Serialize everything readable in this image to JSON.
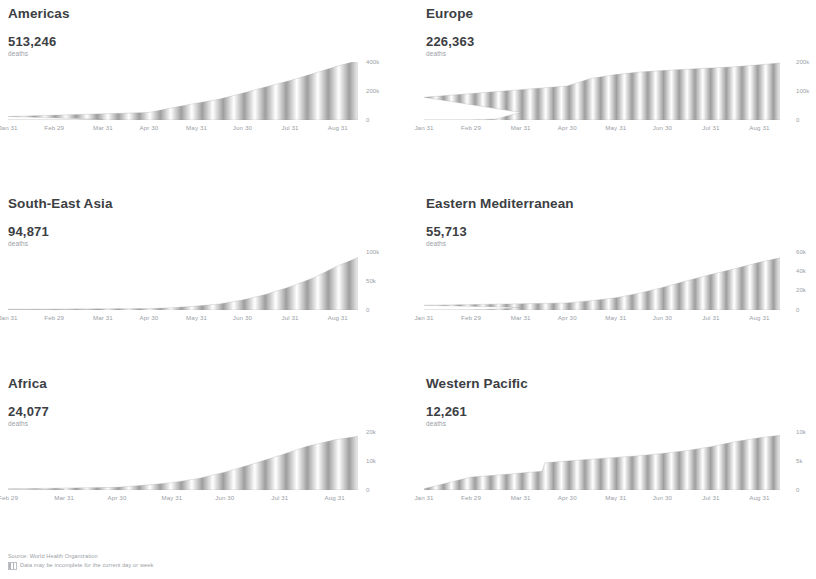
{
  "footer": {
    "source": "Source: World Health Organization",
    "note": "Data may be incomplete for the current day or week",
    "note_icon": "hatched-square-icon"
  },
  "colors": {
    "title": "#3c4043",
    "value": "#3c4043",
    "muted": "#9aa0a6",
    "series_fill": "#9e9e9e",
    "background": "#ffffff"
  },
  "unit_label": "deaths",
  "chart_data": [
    {
      "type": "area",
      "title": "Americas",
      "total_value": "513,246",
      "total_value_number": 513246,
      "unit": "deaths",
      "xlabel": "",
      "ylabel": "",
      "grid": false,
      "legend": "none",
      "x_ticks": [
        "Jan 31",
        "Feb 29",
        "Mar 31",
        "Apr 30",
        "May 31",
        "Jun 30",
        "Jul 31",
        "Aug 31"
      ],
      "y_ticks": [
        "400k",
        "200k",
        "0"
      ],
      "ylim": [
        0,
        500000
      ],
      "series": [
        {
          "name": "Cumulative deaths",
          "x": [
            "Jan 31",
            "Feb 29",
            "Mar 15",
            "Mar 31",
            "Apr 15",
            "Apr 30",
            "May 15",
            "May 31",
            "Jun 15",
            "Jun 30",
            "Jul 15",
            "Jul 31",
            "Aug 15",
            "Aug 31",
            "Sep 10"
          ],
          "values": [
            0,
            0,
            800,
            5500,
            30000,
            65000,
            105000,
            145000,
            180000,
            230000,
            285000,
            340000,
            400000,
            465000,
            513246
          ]
        }
      ]
    },
    {
      "type": "area",
      "title": "Europe",
      "total_value": "226,363",
      "total_value_number": 226363,
      "unit": "deaths",
      "xlabel": "",
      "ylabel": "",
      "grid": false,
      "legend": "none",
      "x_ticks": [
        "Jan 31",
        "Feb 29",
        "Mar 31",
        "Apr 30",
        "May 31",
        "Jun 30",
        "Jul 31",
        "Aug 31"
      ],
      "y_ticks": [
        "200k",
        "100k",
        "0"
      ],
      "ylim": [
        0,
        230000
      ],
      "series": [
        {
          "name": "Cumulative deaths",
          "x": [
            "Jan 31",
            "Feb 29",
            "Mar 15",
            "Mar 31",
            "Apr 15",
            "Apr 30",
            "May 15",
            "May 31",
            "Jun 15",
            "Jun 30",
            "Jul 15",
            "Jul 31",
            "Aug 15",
            "Aug 31",
            "Sep 10"
          ],
          "values": [
            0,
            300,
            3000,
            30000,
            90000,
            135000,
            165000,
            180000,
            190000,
            196000,
            201000,
            206000,
            211000,
            219000,
            226363
          ]
        }
      ]
    },
    {
      "type": "area",
      "title": "South-East Asia",
      "total_value": "94,871",
      "total_value_number": 94871,
      "unit": "deaths",
      "xlabel": "",
      "ylabel": "",
      "grid": false,
      "legend": "none",
      "x_ticks": [
        "Jan 31",
        "Feb 29",
        "Mar 31",
        "Apr 30",
        "May 31",
        "Jun 30",
        "Jul 31",
        "Aug 31"
      ],
      "y_ticks": [
        "100k",
        "50k",
        "0"
      ],
      "ylim": [
        0,
        105000
      ],
      "series": [
        {
          "name": "Cumulative deaths",
          "x": [
            "Jan 31",
            "Feb 29",
            "Mar 15",
            "Mar 31",
            "Apr 15",
            "Apr 30",
            "May 15",
            "May 31",
            "Jun 15",
            "Jun 30",
            "Jul 15",
            "Jul 31",
            "Aug 15",
            "Aug 31",
            "Sep 10"
          ],
          "values": [
            0,
            0,
            50,
            400,
            1200,
            2500,
            4200,
            7000,
            11000,
            18000,
            28000,
            42000,
            58000,
            80000,
            94871
          ]
        }
      ]
    },
    {
      "type": "area",
      "title": "Eastern Mediterranean",
      "total_value": "55,713",
      "total_value_number": 55713,
      "unit": "deaths",
      "xlabel": "",
      "ylabel": "",
      "grid": false,
      "legend": "none",
      "x_ticks": [
        "Jan 31",
        "Feb 29",
        "Mar 31",
        "Apr 30",
        "May 31",
        "Jun 30",
        "Jul 31",
        "Aug 31"
      ],
      "y_ticks": [
        "60k",
        "40k",
        "20k",
        "0"
      ],
      "ylim": [
        0,
        62000
      ],
      "series": [
        {
          "name": "Cumulative deaths",
          "x": [
            "Jan 31",
            "Feb 29",
            "Mar 15",
            "Mar 31",
            "Apr 15",
            "Apr 30",
            "May 15",
            "May 31",
            "Jun 15",
            "Jun 30",
            "Jul 15",
            "Jul 31",
            "Aug 15",
            "Aug 31",
            "Sep 10"
          ],
          "values": [
            0,
            100,
            900,
            2700,
            5000,
            7500,
            10000,
            13000,
            18000,
            24000,
            31000,
            38000,
            44000,
            51000,
            55713
          ]
        }
      ]
    },
    {
      "type": "area",
      "title": "Africa",
      "total_value": "24,077",
      "total_value_number": 24077,
      "unit": "deaths",
      "xlabel": "",
      "ylabel": "",
      "grid": false,
      "legend": "none",
      "x_ticks": [
        "Feb 29",
        "Mar 31",
        "Apr 30",
        "May 31",
        "Jun 30",
        "Jul 31",
        "Aug 31"
      ],
      "y_ticks": [
        "20k",
        "10k",
        "0"
      ],
      "ylim": [
        0,
        26000
      ],
      "series": [
        {
          "name": "Cumulative deaths",
          "x": [
            "Feb 29",
            "Mar 15",
            "Mar 31",
            "Apr 15",
            "Apr 30",
            "May 15",
            "May 31",
            "Jun 15",
            "Jun 30",
            "Jul 15",
            "Jul 31",
            "Aug 15",
            "Aug 31",
            "Sep 10"
          ],
          "values": [
            0,
            20,
            150,
            500,
            1200,
            2100,
            3300,
            5200,
            8000,
            11500,
            15500,
            19500,
            22500,
            24077
          ]
        }
      ]
    },
    {
      "type": "area",
      "title": "Western Pacific",
      "total_value": "12,261",
      "total_value_number": 12261,
      "unit": "deaths",
      "xlabel": "",
      "ylabel": "",
      "grid": false,
      "legend": "none",
      "x_ticks": [
        "Jan 31",
        "Feb 29",
        "Mar 31",
        "Apr 30",
        "May 31",
        "Jun 30",
        "Jul 31",
        "Aug 31"
      ],
      "y_ticks": [
        "10k",
        "5k",
        "0"
      ],
      "ylim": [
        0,
        13000
      ],
      "series": [
        {
          "name": "Cumulative deaths",
          "x": [
            "Jan 31",
            "Feb 29",
            "Mar 15",
            "Mar 31",
            "Apr 14",
            "Apr 16",
            "Apr 30",
            "May 15",
            "May 31",
            "Jun 15",
            "Jun 30",
            "Jul 15",
            "Jul 31",
            "Aug 15",
            "Aug 31",
            "Sep 10"
          ],
          "values": [
            300,
            2900,
            3300,
            3800,
            4200,
            6100,
            6500,
            6900,
            7300,
            7700,
            8200,
            8800,
            9700,
            10800,
            11700,
            12261
          ]
        }
      ]
    }
  ]
}
